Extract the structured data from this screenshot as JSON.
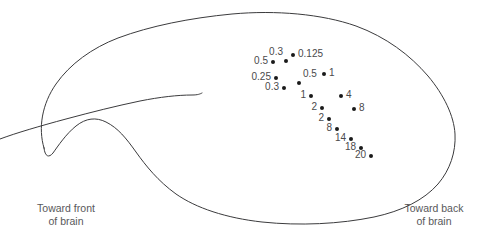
{
  "figure": {
    "outline_stroke": "#3b3b3d",
    "point_color": "#1a1a1a",
    "label_color": "#4a4a4c"
  },
  "captions": {
    "front": {
      "line1": "Toward front",
      "line2": "of brain"
    },
    "back": {
      "line1": "Toward back",
      "line2": "of brain"
    }
  },
  "chart_data": {
    "type": "scatter",
    "title": "",
    "xlabel": "",
    "ylabel": "",
    "annotations": [
      "Toward front of brain",
      "Toward back of brain"
    ],
    "grid": false,
    "legend": null,
    "points": [
      {
        "label": "0.3",
        "x": 286,
        "y": 61,
        "label_pos": "above-left"
      },
      {
        "label": "0.125",
        "x": 293,
        "y": 55,
        "label_pos": "right"
      },
      {
        "label": "0.5",
        "x": 273,
        "y": 62,
        "label_pos": "left"
      },
      {
        "label": "0.25",
        "x": 276,
        "y": 78,
        "label_pos": "left"
      },
      {
        "label": "0.3",
        "x": 284,
        "y": 88,
        "label_pos": "left"
      },
      {
        "label": "0.5",
        "x": 299,
        "y": 83,
        "label_pos": "above"
      },
      {
        "label": "1",
        "x": 324,
        "y": 74,
        "label_pos": "right"
      },
      {
        "label": "1",
        "x": 311,
        "y": 96,
        "label_pos": "left"
      },
      {
        "label": "2",
        "x": 322,
        "y": 108,
        "label_pos": "left"
      },
      {
        "label": "2",
        "x": 329,
        "y": 119,
        "label_pos": "left"
      },
      {
        "label": "4",
        "x": 341,
        "y": 96,
        "label_pos": "right"
      },
      {
        "label": "8",
        "x": 354,
        "y": 109,
        "label_pos": "right"
      },
      {
        "label": "8",
        "x": 337,
        "y": 129,
        "label_pos": "left"
      },
      {
        "label": "14",
        "x": 351,
        "y": 139,
        "label_pos": "left"
      },
      {
        "label": "18",
        "x": 361,
        "y": 148,
        "label_pos": "left"
      },
      {
        "label": "20",
        "x": 371,
        "y": 156,
        "label_pos": "left"
      }
    ]
  }
}
